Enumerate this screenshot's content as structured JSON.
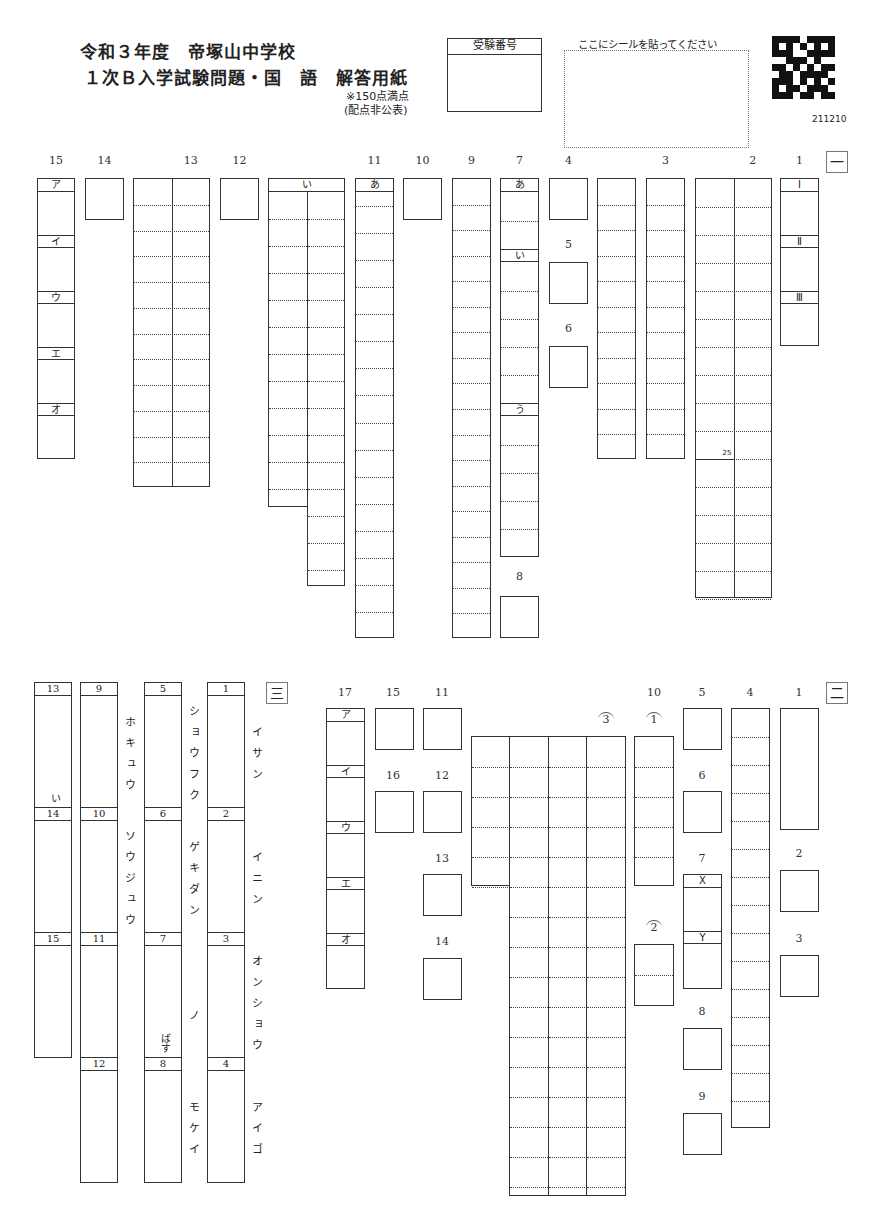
{
  "header": {
    "title_line1": "令和３年度　帝塚山中学校",
    "title_line2": "１次Ｂ入学試験問題・国　語　解答用紙",
    "score_note1": "※150点満点",
    "score_note2": "(配点非公表)",
    "exam_number_label": "受験番号",
    "sticker_label": "ここにシールを貼ってください",
    "qr_code_text": "211210"
  },
  "section1": {
    "mark": "一",
    "questions": [
      {
        "id": "15",
        "label": "15",
        "x": 37,
        "y": 178,
        "w": 38,
        "h": 281,
        "cols": 1,
        "rows": 0,
        "sublabels": [
          {
            "t": "ア",
            "y": 0
          },
          {
            "t": "イ",
            "y": 56
          },
          {
            "t": "ウ",
            "y": 112
          },
          {
            "t": "エ",
            "y": 168
          },
          {
            "t": "オ",
            "y": 224
          }
        ]
      },
      {
        "id": "14",
        "label": "14",
        "x": 85,
        "y": 178,
        "w": 39,
        "h": 42,
        "cols": 1,
        "rows": 0
      },
      {
        "id": "13",
        "label": "13",
        "x": 133,
        "y": 178,
        "w": 77,
        "h": 309,
        "cols": 2,
        "rows": 11
      },
      {
        "id": "12",
        "label": "12",
        "x": 220,
        "y": 178,
        "w": 39,
        "h": 42,
        "cols": 1,
        "rows": 0
      },
      {
        "id": "11-i",
        "label": "",
        "x": 268,
        "y": 178,
        "w": 77,
        "h": 329,
        "cols": 2,
        "rows": 0,
        "special": "i"
      },
      {
        "id": "11",
        "label": "11",
        "x": 355,
        "y": 178,
        "w": 39,
        "h": 460,
        "cols": 1,
        "rows": 16,
        "sublabels": [
          {
            "t": "あ",
            "y": 0
          }
        ]
      },
      {
        "id": "10",
        "label": "10",
        "x": 403,
        "y": 178,
        "w": 39,
        "h": 42,
        "cols": 1,
        "rows": 0
      },
      {
        "id": "9",
        "label": "9",
        "x": 452,
        "y": 178,
        "w": 39,
        "h": 460,
        "cols": 1,
        "rows": 17
      },
      {
        "id": "7",
        "label": "7",
        "x": 500,
        "y": 178,
        "w": 39,
        "h": 379,
        "cols": 1,
        "rows": 0,
        "special": "seven"
      },
      {
        "id": "8",
        "label": "8",
        "x": 500,
        "y": 596,
        "w": 39,
        "h": 42,
        "cols": 1,
        "rows": 0,
        "labelTop": 570
      },
      {
        "id": "4",
        "label": "4",
        "x": 549,
        "y": 178,
        "w": 39,
        "h": 42,
        "cols": 1,
        "rows": 0
      },
      {
        "id": "5",
        "label": "5",
        "x": 549,
        "y": 262,
        "w": 39,
        "h": 42,
        "cols": 1,
        "rows": 0,
        "labelTop": 238
      },
      {
        "id": "6",
        "label": "6",
        "x": 549,
        "y": 346,
        "w": 39,
        "h": 42,
        "cols": 1,
        "rows": 0,
        "labelTop": 322
      },
      {
        "id": "3a",
        "label": "",
        "x": 597,
        "y": 178,
        "w": 39,
        "h": 281,
        "cols": 1,
        "rows": 10
      },
      {
        "id": "3",
        "label": "3",
        "x": 646,
        "y": 178,
        "w": 39,
        "h": 281,
        "cols": 1,
        "rows": 10
      },
      {
        "id": "2",
        "label": "2",
        "x": 695,
        "y": 178,
        "w": 77,
        "h": 420,
        "cols": 2,
        "rows": 15,
        "special": "two"
      },
      {
        "id": "1",
        "label": "1",
        "x": 780,
        "y": 178,
        "w": 39,
        "h": 168,
        "cols": 1,
        "rows": 0,
        "sublabels": [
          {
            "t": "Ⅰ",
            "y": 0
          },
          {
            "t": "Ⅱ",
            "y": 56
          },
          {
            "t": "Ⅲ",
            "y": 112
          }
        ]
      }
    ],
    "char_count_marker": "25",
    "i_label": "い"
  },
  "section3": {
    "mark": "三",
    "items": [
      {
        "num": "1",
        "reading": "イサン"
      },
      {
        "num": "2",
        "reading": "イニン"
      },
      {
        "num": "3",
        "reading": "オンショウ"
      },
      {
        "num": "4",
        "reading": "アイゴ"
      },
      {
        "num": "5",
        "reading": "ショウフク"
      },
      {
        "num": "6",
        "reading": "ゲキダン"
      },
      {
        "num": "7",
        "reading": "ノ",
        "suffix": "ばす"
      },
      {
        "num": "8",
        "reading": "モケイ"
      },
      {
        "num": "9",
        "reading": "ホキュウ"
      },
      {
        "num": "10",
        "reading": "ソウジュウ"
      },
      {
        "num": "11",
        "reading": ""
      },
      {
        "num": "12",
        "reading": ""
      },
      {
        "num": "13",
        "reading": "",
        "suffix": "い"
      },
      {
        "num": "14",
        "reading": ""
      },
      {
        "num": "15",
        "reading": ""
      }
    ]
  },
  "section2": {
    "mark": "二",
    "q17_sublabels": [
      "ア",
      "イ",
      "ウ",
      "エ",
      "オ"
    ],
    "labels": {
      "q1": "1",
      "q2": "2",
      "q3": "3",
      "q4": "4",
      "q5": "5",
      "q6": "6",
      "q7": "7",
      "q8": "8",
      "q9": "9",
      "q10": "10",
      "q11": "11",
      "q12": "12",
      "q13": "13",
      "q14": "14",
      "q15": "15",
      "q16": "16",
      "q17": "17",
      "circ1": "1",
      "circ2": "2",
      "circ3": "3",
      "x": "X",
      "y": "Y"
    }
  }
}
